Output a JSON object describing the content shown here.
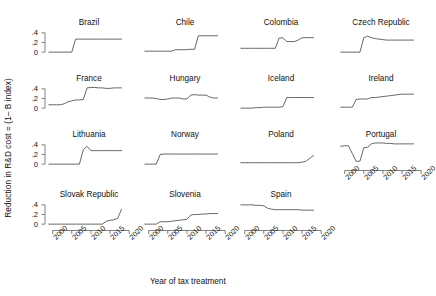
{
  "chart_data": {
    "type": "line",
    "title": "",
    "xlabel": "Year of tax treatment",
    "ylabel": "Reduction in R&D cost = (1– B index)",
    "xlim": [
      1998,
      2021
    ],
    "ylim": [
      -0.08,
      0.48
    ],
    "grid": false,
    "legend": "none",
    "xticks": [
      2000,
      2005,
      2010,
      2015,
      2020
    ],
    "xticklabels": [
      "2000",
      "2005",
      "2010",
      "2015",
      "2020"
    ],
    "yticks": [
      0,
      0.2,
      0.4
    ],
    "yticklabels": [
      "0",
      ".2",
      ".4"
    ],
    "layout": {
      "rows": 4,
      "cols": 4,
      "panels_in_last_row": 3
    },
    "panels": [
      {
        "name": "Brazil",
        "row": 0,
        "col": 0,
        "x": [
          1999,
          2000,
          2001,
          2002,
          2003,
          2004,
          2005,
          2006,
          2007,
          2008,
          2009,
          2010,
          2011,
          2012,
          2013,
          2014,
          2015,
          2016,
          2017,
          2018
        ],
        "y": [
          0.0,
          0.0,
          0.0,
          0.0,
          0.0,
          0.0,
          0.0,
          0.27,
          0.27,
          0.27,
          0.27,
          0.27,
          0.27,
          0.27,
          0.27,
          0.27,
          0.27,
          0.27,
          0.27,
          0.27
        ]
      },
      {
        "name": "Chile",
        "row": 0,
        "col": 1,
        "x": [
          1999,
          2000,
          2001,
          2002,
          2003,
          2004,
          2005,
          2006,
          2007,
          2008,
          2009,
          2010,
          2011,
          2012,
          2013,
          2014,
          2015,
          2016,
          2017,
          2018
        ],
        "y": [
          0.02,
          0.02,
          0.02,
          0.02,
          0.02,
          0.02,
          0.02,
          0.02,
          0.05,
          0.05,
          0.05,
          0.05,
          0.06,
          0.06,
          0.34,
          0.34,
          0.34,
          0.34,
          0.34,
          0.34
        ]
      },
      {
        "name": "Colombia",
        "row": 0,
        "col": 2,
        "x": [
          1999,
          2000,
          2001,
          2002,
          2003,
          2004,
          2005,
          2006,
          2007,
          2008,
          2009,
          2010,
          2011,
          2012,
          2013,
          2014,
          2015,
          2016,
          2017,
          2018
        ],
        "y": [
          0.08,
          0.08,
          0.08,
          0.08,
          0.08,
          0.08,
          0.08,
          0.08,
          0.08,
          0.08,
          0.29,
          0.3,
          0.22,
          0.22,
          0.22,
          0.25,
          0.3,
          0.3,
          0.3,
          0.3
        ]
      },
      {
        "name": "Czech Republic",
        "row": 0,
        "col": 3,
        "x": [
          1999,
          2000,
          2001,
          2002,
          2003,
          2004,
          2005,
          2006,
          2007,
          2008,
          2009,
          2010,
          2011,
          2012,
          2013,
          2014,
          2015,
          2016,
          2017,
          2018
        ],
        "y": [
          0.0,
          0.0,
          0.0,
          0.0,
          0.0,
          0.0,
          0.3,
          0.33,
          0.3,
          0.28,
          0.27,
          0.26,
          0.25,
          0.25,
          0.25,
          0.25,
          0.25,
          0.25,
          0.25,
          0.25
        ]
      },
      {
        "name": "France",
        "row": 1,
        "col": 0,
        "x": [
          1999,
          2000,
          2001,
          2002,
          2003,
          2004,
          2005,
          2006,
          2007,
          2008,
          2009,
          2010,
          2011,
          2012,
          2013,
          2014,
          2015,
          2016,
          2017,
          2018
        ],
        "y": [
          0.07,
          0.07,
          0.07,
          0.07,
          0.09,
          0.13,
          0.15,
          0.17,
          0.17,
          0.18,
          0.42,
          0.43,
          0.43,
          0.42,
          0.42,
          0.41,
          0.41,
          0.42,
          0.42,
          0.42
        ]
      },
      {
        "name": "Hungary",
        "row": 1,
        "col": 1,
        "x": [
          1999,
          2000,
          2001,
          2002,
          2003,
          2004,
          2005,
          2006,
          2007,
          2008,
          2009,
          2010,
          2011,
          2012,
          2013,
          2014,
          2015,
          2016,
          2017,
          2018
        ],
        "y": [
          0.21,
          0.21,
          0.21,
          0.2,
          0.18,
          0.18,
          0.19,
          0.21,
          0.21,
          0.21,
          0.19,
          0.19,
          0.27,
          0.28,
          0.27,
          0.27,
          0.27,
          0.23,
          0.21,
          0.21
        ]
      },
      {
        "name": "Iceland",
        "row": 1,
        "col": 2,
        "x": [
          1999,
          2000,
          2001,
          2002,
          2003,
          2004,
          2005,
          2006,
          2007,
          2008,
          2009,
          2010,
          2011,
          2012,
          2013,
          2014,
          2015,
          2016,
          2017,
          2018
        ],
        "y": [
          0.0,
          0.0,
          0.0,
          0.0,
          0.01,
          0.01,
          0.02,
          0.02,
          0.02,
          0.02,
          0.02,
          0.03,
          0.22,
          0.22,
          0.22,
          0.22,
          0.22,
          0.22,
          0.22,
          0.22
        ]
      },
      {
        "name": "Ireland",
        "row": 1,
        "col": 3,
        "x": [
          1999,
          2000,
          2001,
          2002,
          2003,
          2004,
          2005,
          2006,
          2007,
          2008,
          2009,
          2010,
          2011,
          2012,
          2013,
          2014,
          2015,
          2016,
          2017,
          2018
        ],
        "y": [
          0.02,
          0.02,
          0.02,
          0.02,
          0.18,
          0.19,
          0.19,
          0.19,
          0.22,
          0.22,
          0.23,
          0.24,
          0.25,
          0.26,
          0.27,
          0.28,
          0.29,
          0.29,
          0.29,
          0.29
        ]
      },
      {
        "name": "Lithuania",
        "row": 2,
        "col": 0,
        "x": [
          1999,
          2000,
          2001,
          2002,
          2003,
          2004,
          2005,
          2006,
          2007,
          2008,
          2009,
          2010,
          2011,
          2012,
          2013,
          2014,
          2015,
          2016,
          2017,
          2018
        ],
        "y": [
          0.0,
          0.0,
          0.0,
          0.0,
          0.0,
          0.0,
          0.0,
          0.0,
          0.0,
          0.3,
          0.37,
          0.28,
          0.28,
          0.28,
          0.28,
          0.28,
          0.28,
          0.28,
          0.28,
          0.28
        ]
      },
      {
        "name": "Norway",
        "row": 2,
        "col": 1,
        "x": [
          1999,
          2000,
          2001,
          2002,
          2003,
          2004,
          2005,
          2006,
          2007,
          2008,
          2009,
          2010,
          2011,
          2012,
          2013,
          2014,
          2015,
          2016,
          2017,
          2018
        ],
        "y": [
          0.0,
          0.0,
          0.0,
          0.0,
          0.2,
          0.21,
          0.21,
          0.21,
          0.21,
          0.21,
          0.21,
          0.21,
          0.21,
          0.21,
          0.21,
          0.21,
          0.21,
          0.21,
          0.21,
          0.21
        ]
      },
      {
        "name": "Poland",
        "row": 2,
        "col": 2,
        "x": [
          1999,
          2000,
          2001,
          2002,
          2003,
          2004,
          2005,
          2006,
          2007,
          2008,
          2009,
          2010,
          2011,
          2012,
          2013,
          2014,
          2015,
          2016,
          2017,
          2018
        ],
        "y": [
          0.03,
          0.03,
          0.03,
          0.03,
          0.03,
          0.03,
          0.03,
          0.03,
          0.03,
          0.03,
          0.03,
          0.03,
          0.03,
          0.03,
          0.03,
          0.03,
          0.04,
          0.06,
          0.12,
          0.18
        ]
      },
      {
        "name": "Portugal",
        "row": 2,
        "col": 3,
        "x": [
          1999,
          2000,
          2001,
          2002,
          2003,
          2004,
          2005,
          2006,
          2007,
          2008,
          2009,
          2010,
          2011,
          2012,
          2013,
          2014,
          2015,
          2016,
          2017,
          2018
        ],
        "y": [
          0.37,
          0.38,
          0.38,
          0.22,
          0.06,
          0.06,
          0.34,
          0.35,
          0.42,
          0.44,
          0.44,
          0.44,
          0.43,
          0.43,
          0.42,
          0.42,
          0.42,
          0.42,
          0.42,
          0.42
        ]
      },
      {
        "name": "Slovak Republic",
        "row": 3,
        "col": 0,
        "x": [
          1999,
          2000,
          2001,
          2002,
          2003,
          2004,
          2005,
          2006,
          2007,
          2008,
          2009,
          2010,
          2011,
          2012,
          2013,
          2014,
          2015,
          2016,
          2017,
          2018
        ],
        "y": [
          0.0,
          0.0,
          0.0,
          0.0,
          0.0,
          0.0,
          0.0,
          0.0,
          0.0,
          0.0,
          0.0,
          0.0,
          0.0,
          0.0,
          0.0,
          0.06,
          0.08,
          0.09,
          0.12,
          0.31
        ]
      },
      {
        "name": "Slovenia",
        "row": 3,
        "col": 1,
        "x": [
          1999,
          2000,
          2001,
          2002,
          2003,
          2004,
          2005,
          2006,
          2007,
          2008,
          2009,
          2010,
          2011,
          2012,
          2013,
          2014,
          2015,
          2016,
          2017,
          2018
        ],
        "y": [
          0.0,
          0.0,
          0.0,
          0.0,
          0.05,
          0.05,
          0.05,
          0.06,
          0.07,
          0.08,
          0.09,
          0.1,
          0.19,
          0.2,
          0.2,
          0.21,
          0.21,
          0.22,
          0.22,
          0.22
        ]
      },
      {
        "name": "Spain",
        "row": 3,
        "col": 2,
        "x": [
          1999,
          2000,
          2001,
          2002,
          2003,
          2004,
          2005,
          2006,
          2007,
          2008,
          2009,
          2010,
          2011,
          2012,
          2013,
          2014,
          2015,
          2016,
          2017,
          2018
        ],
        "y": [
          0.4,
          0.4,
          0.4,
          0.4,
          0.39,
          0.39,
          0.38,
          0.33,
          0.31,
          0.3,
          0.3,
          0.3,
          0.3,
          0.3,
          0.3,
          0.3,
          0.29,
          0.29,
          0.29,
          0.29
        ]
      }
    ]
  }
}
